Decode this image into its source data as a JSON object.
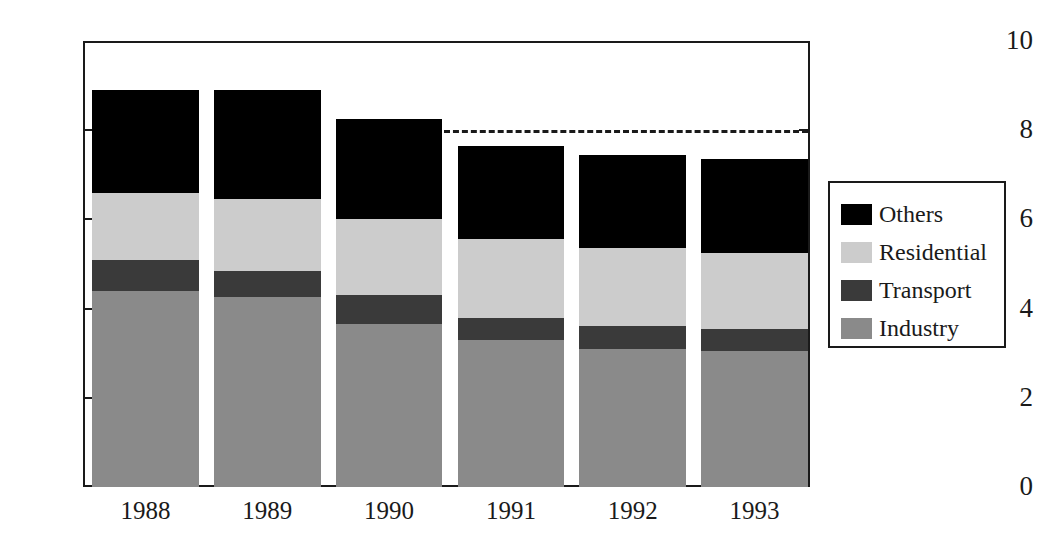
{
  "chart_data": {
    "type": "bar",
    "subtype": "stacked-vertical",
    "title": "",
    "subtitle": "",
    "xlabel": "",
    "ylabel": "",
    "categories": [
      "1988",
      "1989",
      "1990",
      "1991",
      "1992",
      "1993"
    ],
    "series": [
      {
        "name": "Industry",
        "color": "#8a8a8a",
        "values": [
          4.4,
          4.25,
          3.65,
          3.3,
          3.1,
          3.05
        ]
      },
      {
        "name": "Transport",
        "color": "#3a3a3a",
        "values": [
          0.7,
          0.6,
          0.65,
          0.5,
          0.5,
          0.5
        ]
      },
      {
        "name": "Residential",
        "color": "#cccccc",
        "values": [
          1.5,
          1.6,
          1.7,
          1.75,
          1.75,
          1.7
        ]
      },
      {
        "name": "Others",
        "color": "#000000",
        "values": [
          2.3,
          2.45,
          2.25,
          2.1,
          2.1,
          2.1
        ]
      }
    ],
    "stack_order_bottom_to_top": [
      "Industry",
      "Transport",
      "Residential",
      "Others"
    ],
    "totals": [
      8.9,
      8.9,
      8.25,
      7.65,
      7.45,
      7.35
    ],
    "ylim": [
      0,
      10
    ],
    "ytick_labels": [
      "0",
      "2",
      "4",
      "6",
      "8",
      "10"
    ],
    "ytick_values": [
      0,
      2,
      4,
      6,
      8,
      10
    ],
    "grid": false,
    "legend_position": "right",
    "annotations": [
      {
        "name": "target-line",
        "type": "horizontal-dashed-line",
        "value": 8.0,
        "label": "",
        "x_start_category_index": 3,
        "x_end": "plot-right-edge",
        "color": "#1a1a1a"
      }
    ]
  },
  "legend": {
    "items": [
      {
        "label": "Others",
        "color": "#000000"
      },
      {
        "label": "Residential",
        "color": "#cccccc"
      },
      {
        "label": "Transport",
        "color": "#3a3a3a"
      },
      {
        "label": "Industry",
        "color": "#8a8a8a"
      }
    ]
  },
  "axis": {
    "y_ticks": [
      {
        "label": "10",
        "value": 10
      },
      {
        "label": "8",
        "value": 8
      },
      {
        "label": "6",
        "value": 6
      },
      {
        "label": "4",
        "value": 4
      },
      {
        "label": "2",
        "value": 2
      },
      {
        "label": "0",
        "value": 0
      }
    ],
    "x_ticks": [
      {
        "label": "1988"
      },
      {
        "label": "1989"
      },
      {
        "label": "1990"
      },
      {
        "label": "1991"
      },
      {
        "label": "1992"
      },
      {
        "label": "1993"
      }
    ]
  },
  "colors": {
    "axis": "#1a1a1a",
    "background": "#ffffff",
    "others": "#000000",
    "residential": "#cccccc",
    "transport": "#3a3a3a",
    "industry": "#8a8a8a"
  }
}
